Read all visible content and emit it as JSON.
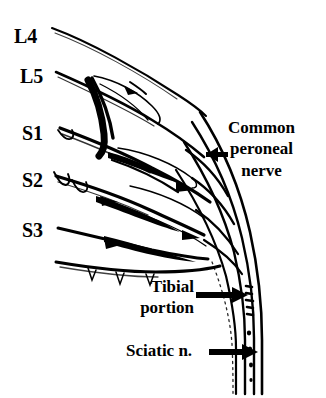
{
  "figure": {
    "kind": "anatomical-line-drawing",
    "background_color": "#ffffff",
    "ink_color": "#000000",
    "width": 326,
    "height": 398
  },
  "root_labels": [
    {
      "id": "l4",
      "text": "L4"
    },
    {
      "id": "l5",
      "text": "L5"
    },
    {
      "id": "s1",
      "text": "S1"
    },
    {
      "id": "s2",
      "text": "S2"
    },
    {
      "id": "s3",
      "text": "S3"
    }
  ],
  "annotations": [
    {
      "id": "common-peroneal",
      "lines": [
        "Common",
        "peroneal",
        "nerve"
      ],
      "arrow_direction": "left"
    },
    {
      "id": "tibial-portion",
      "lines": [
        "Tibial",
        "portion"
      ],
      "arrow_direction": "right"
    },
    {
      "id": "sciatic-nerve",
      "lines": [
        "Sciatic n."
      ],
      "arrow_direction": "right"
    }
  ]
}
